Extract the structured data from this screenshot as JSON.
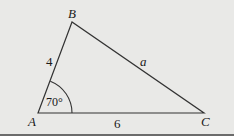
{
  "diagram": {
    "type": "triangle",
    "vertices": {
      "A": {
        "label": "A",
        "x": 38,
        "y": 113
      },
      "B": {
        "label": "B",
        "x": 72,
        "y": 22
      },
      "C": {
        "label": "C",
        "x": 204,
        "y": 113
      }
    },
    "sides": {
      "AB": {
        "label": "4"
      },
      "BC": {
        "label": "a"
      },
      "AC": {
        "label": "6"
      }
    },
    "angle_A": {
      "label": "70°"
    },
    "colors": {
      "background": "#e9e9e7",
      "stroke": "#333333",
      "border": "#6b6b6b"
    }
  }
}
